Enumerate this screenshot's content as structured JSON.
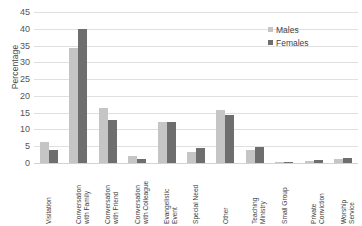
{
  "chart_data": {
    "type": "bar",
    "title": "",
    "xlabel": "",
    "ylabel": "Percentage",
    "ylim": [
      0,
      45
    ],
    "ytick_step": 5,
    "yticks": [
      0,
      5,
      10,
      15,
      20,
      25,
      30,
      35,
      40,
      45
    ],
    "grid": true,
    "legend_position": "top-right",
    "categories": [
      "Visitation",
      "Conversation with Family",
      "Conversation with Friend",
      "Conversation with Colleague",
      "Evangelistic Event",
      "Special Need",
      "Other",
      "Teaching Ministry",
      "Small Group",
      "Private Conviction",
      "Worship Service"
    ],
    "category_lines": [
      [
        "Visitation",
        ""
      ],
      [
        "Conversation",
        "with Family"
      ],
      [
        "Conversation",
        "with Friend"
      ],
      [
        "Conversation",
        "with Colleague"
      ],
      [
        "Evangelistic",
        "Event"
      ],
      [
        "Special Need",
        ""
      ],
      [
        "Other",
        ""
      ],
      [
        "Teaching",
        "Ministry"
      ],
      [
        "Small Group",
        ""
      ],
      [
        "Private",
        "Conviction"
      ],
      [
        "Worship",
        "Service"
      ]
    ],
    "series": [
      {
        "name": "Males",
        "color": "#c5c5c5",
        "values": [
          6.2,
          34.3,
          16.5,
          2.2,
          12.1,
          3.4,
          15.8,
          3.8,
          0.2,
          0.5,
          1.2
        ]
      },
      {
        "name": "Females",
        "color": "#6e6e6e",
        "values": [
          4.0,
          40.0,
          12.7,
          1.2,
          12.1,
          4.4,
          14.2,
          4.8,
          0.2,
          1.0,
          1.6
        ]
      }
    ]
  },
  "legend": {
    "items": [
      {
        "label": "Males"
      },
      {
        "label": "Females"
      }
    ]
  },
  "colors": {
    "males": "#c5c5c5",
    "females": "#6e6e6e",
    "gridline": "#e0e0e0",
    "text": "#3f3f3f",
    "background": "#ffffff"
  }
}
